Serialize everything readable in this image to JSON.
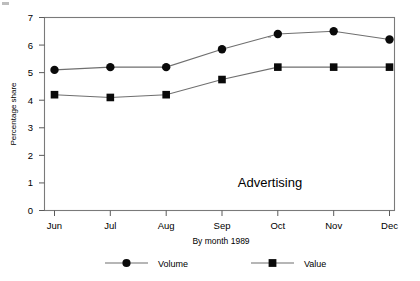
{
  "chart_data": {
    "type": "line",
    "title": "",
    "annotation": "Advertising",
    "xlabel": "By month 1989",
    "ylabel": "Percentage share",
    "categories": [
      "Jun",
      "Jul",
      "Aug",
      "Sep",
      "Oct",
      "Nov",
      "Dec"
    ],
    "ylim": [
      0,
      7
    ],
    "yticks": [
      0,
      1,
      2,
      3,
      4,
      5,
      6,
      7
    ],
    "ytick_labels": [
      "0",
      "1",
      "2",
      "3",
      "4",
      "5",
      "6",
      "7"
    ],
    "grid": false,
    "legend_position": "bottom",
    "series": [
      {
        "name": "Volume",
        "marker": "circle",
        "values": [
          5.1,
          5.2,
          5.2,
          5.85,
          6.4,
          6.5,
          6.2
        ]
      },
      {
        "name": "Value",
        "marker": "square",
        "values": [
          4.2,
          4.1,
          4.2,
          4.75,
          5.2,
          5.2,
          5.2
        ]
      }
    ]
  },
  "legend": {
    "items": [
      {
        "label": "Volume",
        "marker": "circle"
      },
      {
        "label": "Value",
        "marker": "square"
      }
    ]
  },
  "colors": {
    "marker": "#0a0a0a",
    "line": "#6f6f6f",
    "frame": "#7a7a7a",
    "text": "#000000",
    "background": "#ffffff"
  }
}
